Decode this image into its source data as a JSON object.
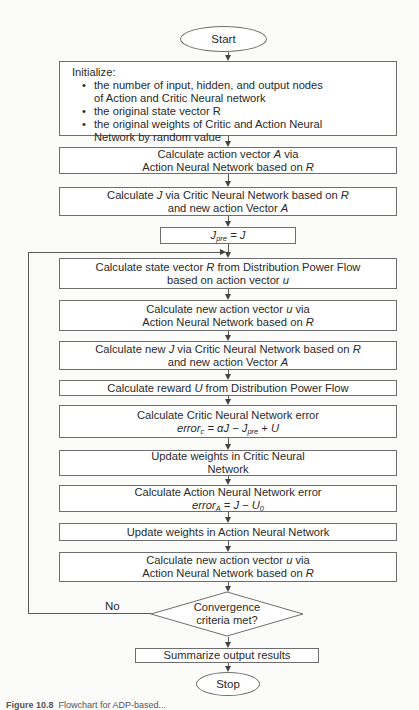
{
  "flowchart": {
    "start": "Start",
    "init": {
      "heading": "Initialize:",
      "bullets": [
        "the number of input, hidden, and output nodes of Action and Critic Neural network",
        "the original state vector R",
        "the original weights of Critic and Action Neural Network by random value"
      ]
    },
    "steps": [
      {
        "line1_a": "Calculate action vector ",
        "line1_var": "A",
        "line1_b": " via",
        "line2_a": "Action Neural Network based on ",
        "line2_var": "R"
      },
      {
        "line1_a": "Calculate ",
        "line1_var": "J",
        "line1_b": " via Critic Neural Network based on ",
        "line1_var2": "R",
        "line2_a": "and new action Vector ",
        "line2_var": "A"
      },
      {
        "lhs": "J",
        "lhs_sub": "pre",
        "rhs": " = J"
      },
      {
        "line1_a": "Calculate state vector ",
        "line1_var": "R",
        "line1_b": " from Distribution Power Flow",
        "line2_a": "based on action vector ",
        "line2_var": "u"
      },
      {
        "line1_a": "Calculate new action vector ",
        "line1_var": "u",
        "line1_b": " via",
        "line2_a": "Action Neural Network based on ",
        "line2_var": "R"
      },
      {
        "line1_a": "Calculate new ",
        "line1_var": "J",
        "line1_b": " via Critic Neural Network based on ",
        "line1_var2": "R",
        "line2_a": "and new action Vector ",
        "line2_var": "A"
      },
      {
        "line1_a": "Calculate reward ",
        "line1_var": "U",
        "line1_b": " from Distribution Power Flow"
      },
      {
        "line1": "Calculate Critic Neural Network error",
        "formula_a": "error",
        "formula_sub": "c",
        "formula_b": " = αJ − J",
        "formula_sub2": "pre",
        "formula_c": " + U"
      },
      {
        "line1": "Update weights in Critic Neural",
        "line2": "Network"
      },
      {
        "line1": "Calculate Action Neural Network error",
        "formula_a": "error",
        "formula_sub": "A",
        "formula_b": " = J − U",
        "formula_sub2": "0"
      },
      {
        "line1": "Update weights in Action Neural Network"
      },
      {
        "line1_a": "Calculate new action vector ",
        "line1_var": "u",
        "line1_b": " via",
        "line2_a": "Action Neural Network based on ",
        "line2_var": "R"
      }
    ],
    "decision": {
      "line1": "Convergence",
      "line2": "criteria met?",
      "no_label": "No"
    },
    "summarize": "Summarize output results",
    "stop": "Stop"
  },
  "caption": {
    "label": "Figure 10.8",
    "text": "Flowchart for ADP-based..."
  }
}
